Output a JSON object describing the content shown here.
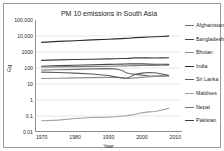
{
  "chart_data": {
    "type": "line",
    "title": "PM 10 emissions in South Asia",
    "xlabel": "Year",
    "ylabel": "Gg",
    "xlim": [
      1968,
      2012
    ],
    "ylim": [
      0.01,
      100000
    ],
    "yscale": "log",
    "grid": true,
    "legend_position": "right",
    "xticks": [
      "1970",
      "1980",
      "1990",
      "2000",
      "2010"
    ],
    "xtick_values": [
      1970,
      1980,
      1990,
      2000,
      2010
    ],
    "yticks": [
      "100,000",
      "10,000",
      "1000",
      "100",
      "10",
      "1",
      "0.1",
      "0.01"
    ],
    "ytick_values": [
      100000,
      10000,
      1000,
      100,
      10,
      1,
      0.1,
      0.01
    ],
    "x": [
      1970,
      1975,
      1980,
      1985,
      1990,
      1992,
      1994,
      1995,
      1996,
      1998,
      2000,
      2002,
      2004,
      2006,
      2008
    ],
    "series": [
      {
        "name": "Afghanistan",
        "color": "#6e6e6e",
        "values": [
          75,
          78,
          82,
          88,
          92,
          88,
          72,
          55,
          45,
          40,
          36,
          33,
          31,
          32,
          33
        ]
      },
      {
        "name": "Bangladesh",
        "color": "#4a4a4a",
        "values": [
          130,
          140,
          150,
          160,
          168,
          172,
          175,
          178,
          180,
          182,
          180,
          175,
          172,
          170,
          168
        ]
      },
      {
        "name": "Bhutan",
        "color": "#8f8f8f",
        "values": [
          22,
          23,
          24,
          25,
          26,
          26,
          25,
          23,
          22,
          24,
          26,
          28,
          30,
          31,
          31
        ]
      },
      {
        "name": "India",
        "color": "#2c2c2c",
        "values": [
          4000,
          4600,
          5100,
          5700,
          6300,
          6600,
          6900,
          7100,
          7300,
          7900,
          8200,
          8600,
          9000,
          9400,
          9800
        ]
      },
      {
        "name": "Sri Lanka",
        "color": "#5c5c5c",
        "values": [
          55,
          52,
          48,
          42,
          34,
          28,
          24,
          23,
          25,
          40,
          48,
          52,
          50,
          42,
          35
        ]
      },
      {
        "name": "Maldives",
        "color": "#a0a0a0",
        "values": [
          0.05,
          0.055,
          0.07,
          0.08,
          0.085,
          0.09,
          0.1,
          0.1,
          0.11,
          0.13,
          0.16,
          0.18,
          0.19,
          0.24,
          0.3
        ]
      },
      {
        "name": "Nepal",
        "color": "#7a7a7a",
        "values": [
          115,
          118,
          122,
          126,
          130,
          132,
          134,
          135,
          137,
          140,
          142,
          144,
          146,
          148,
          150
        ]
      },
      {
        "name": "Pakistan",
        "color": "#3d3d3d",
        "values": [
          300,
          320,
          340,
          355,
          370,
          380,
          390,
          395,
          400,
          430,
          440,
          430,
          425,
          430,
          435
        ]
      }
    ]
  }
}
